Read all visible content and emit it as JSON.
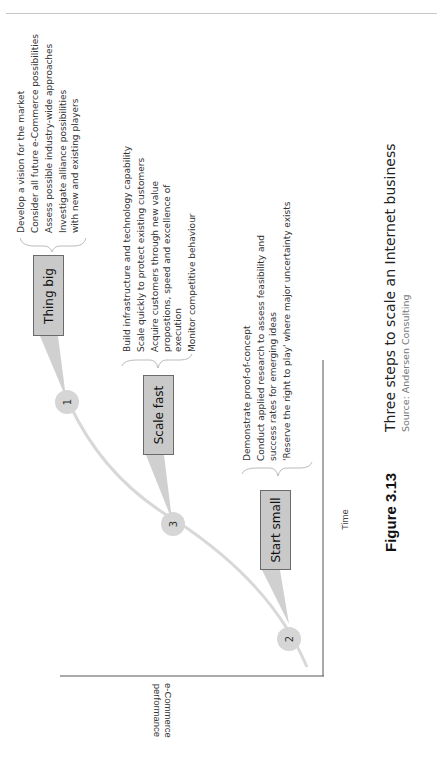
{
  "figure": {
    "number": "Figure 3.13",
    "title": "Three steps to scale an Internet business",
    "source": "Source: Andersen Consulting"
  },
  "axes": {
    "y_label_line1": "e-Commerce",
    "y_label_line2": "performance",
    "x_label": "Time"
  },
  "steps": [
    {
      "number": "2",
      "label": "Start small",
      "bullets": [
        "Demonstrate proof-of-concept",
        "Conduct applied research to assess feasibility and success rates for emerging ideas",
        "'Reserve the right to play' where major uncertainty exists"
      ]
    },
    {
      "number": "3",
      "label": "Scale fast",
      "bullets": [
        "Build infrastructure and technology capability",
        "Scale quickly to protect existing customers",
        "Acquire customers through new value propostions, speed and excellence of execution",
        "Monitor competitive behaviour"
      ]
    },
    {
      "number": "1",
      "label": "Thing big",
      "bullets": [
        "Develop a vision for the market",
        "Consider all future e-Commerce possibilities",
        "Assess possible industry-wide approaches",
        "Investigate alliance possibilities with new and existing players"
      ]
    }
  ],
  "colors": {
    "box_fill": "#c9c9c9",
    "box_border": "#6a6a6a",
    "curve": "#d8d8d8",
    "axis": "#555555"
  }
}
